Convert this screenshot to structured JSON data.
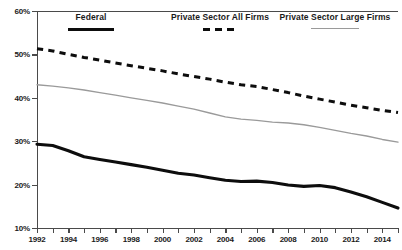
{
  "chart_data": {
    "type": "line",
    "title": "",
    "xlabel": "",
    "ylabel": "",
    "xlim": [
      1992,
      2015
    ],
    "ylim": [
      10,
      60
    ],
    "ytick_labels": [
      "60%",
      "50%",
      "40%",
      "30%",
      "20%",
      "10%"
    ],
    "ytick_values": [
      60,
      50,
      40,
      30,
      20,
      10
    ],
    "xtick_values": [
      1992,
      1993,
      1994,
      1995,
      1996,
      1997,
      1998,
      1999,
      2000,
      2001,
      2002,
      2003,
      2004,
      2005,
      2006,
      2007,
      2008,
      2009,
      2010,
      2011,
      2012,
      2013,
      2014,
      2015
    ],
    "xtick_labels": [
      "1992",
      "",
      "1994",
      "",
      "1996",
      "",
      "1998",
      "",
      "2000",
      "",
      "2002",
      "",
      "2004",
      "",
      "2006",
      "",
      "2008",
      "",
      "2010",
      "",
      "2012",
      "",
      "2014",
      ""
    ],
    "grid": false,
    "legend_position": "top",
    "x": [
      1992,
      1993,
      1994,
      1995,
      1996,
      1997,
      1998,
      1999,
      2000,
      2001,
      2002,
      2003,
      2004,
      2005,
      2006,
      2007,
      2008,
      2009,
      2010,
      2011,
      2012,
      2013,
      2014,
      2015
    ],
    "series": [
      {
        "name": "Federal",
        "style": "solid-thick",
        "color": "#0d0d0d",
        "values": [
          29.3,
          29.0,
          27.8,
          26.4,
          25.8,
          25.2,
          24.6,
          24.0,
          23.3,
          22.6,
          22.2,
          21.6,
          21.0,
          20.7,
          20.8,
          20.5,
          19.9,
          19.6,
          19.8,
          19.3,
          18.3,
          17.2,
          15.9,
          14.6
        ]
      },
      {
        "name": "Private Sector All Firms",
        "style": "dashed",
        "color": "#0d0d0d",
        "values": [
          51.3,
          50.8,
          50.0,
          49.3,
          48.7,
          48.0,
          47.4,
          46.8,
          46.2,
          45.5,
          44.9,
          44.3,
          43.6,
          43.0,
          42.6,
          41.9,
          41.2,
          40.4,
          39.7,
          39.0,
          38.3,
          37.7,
          37.1,
          36.6
        ]
      },
      {
        "name": "Private Sector Large Firms",
        "style": "solid-thin",
        "color": "#9a9a9a",
        "values": [
          43.0,
          42.7,
          42.3,
          41.8,
          41.2,
          40.6,
          40.0,
          39.4,
          38.8,
          38.1,
          37.4,
          36.5,
          35.6,
          35.1,
          34.8,
          34.4,
          34.2,
          33.8,
          33.2,
          32.5,
          31.8,
          31.2,
          30.4,
          29.8
        ]
      }
    ]
  },
  "legend": {
    "items": [
      {
        "label": "Federal",
        "swatch": "solid-thick-black"
      },
      {
        "label": "Private Sector All Firms",
        "swatch": "dashed-black"
      },
      {
        "label": "Private Sector Large Firms",
        "swatch": "solid-thin-gray"
      }
    ]
  }
}
